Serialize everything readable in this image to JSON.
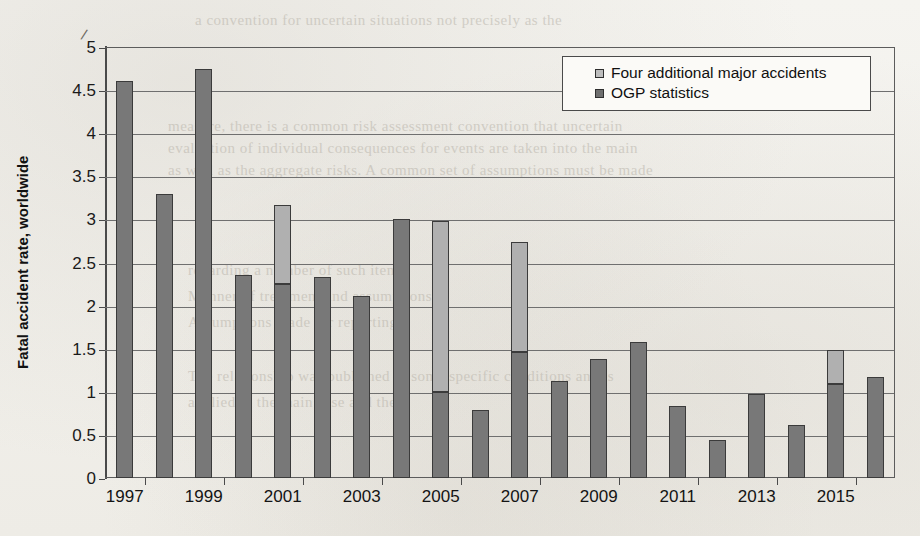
{
  "chart_data": {
    "type": "bar",
    "title": "",
    "subtitle": "",
    "xlabel": "",
    "ylabel": "Fatal accident rate, worldwide",
    "ylim": [
      0,
      5
    ],
    "ytick_step": 0.5,
    "ytick_labels": [
      "0",
      "0.5",
      "1",
      "1.5",
      "2",
      "2.5",
      "3",
      "3.5",
      "4",
      "4.5",
      "5"
    ],
    "grid": true,
    "stacked": true,
    "legend_position": "top-right",
    "categories": [
      "1997",
      "1998",
      "1999",
      "2000",
      "2001",
      "2002",
      "2003",
      "2004",
      "2005",
      "2006",
      "2007",
      "2008",
      "2009",
      "2010",
      "2011",
      "2012",
      "2013",
      "2014",
      "2015",
      "2016"
    ],
    "xtick_labels": [
      "1997",
      "1999",
      "2001",
      "2003",
      "2005",
      "2007",
      "2009",
      "2011",
      "2013",
      "2015"
    ],
    "series": [
      {
        "name": "OGP statistics",
        "color": "#787878",
        "values": [
          4.6,
          3.3,
          4.75,
          2.35,
          2.25,
          2.33,
          2.11,
          3.0,
          1.0,
          0.79,
          1.46,
          1.13,
          1.38,
          1.58,
          0.83,
          0.44,
          0.98,
          0.61,
          1.09,
          1.17
        ]
      },
      {
        "name": "Four additional major accidents",
        "color": "#b0b0b0",
        "values": [
          0.0,
          0.0,
          0.0,
          0.0,
          0.92,
          0.0,
          0.0,
          0.0,
          1.98,
          0.0,
          1.28,
          0.0,
          0.0,
          0.0,
          0.0,
          0.0,
          0.0,
          0.0,
          0.39,
          0.0
        ]
      }
    ],
    "totals": [
      4.6,
      3.3,
      4.75,
      2.35,
      3.17,
      2.33,
      2.11,
      3.0,
      2.98,
      0.79,
      2.74,
      1.13,
      1.38,
      1.58,
      0.83,
      0.44,
      0.98,
      0.61,
      1.48,
      1.17
    ]
  },
  "legend": {
    "items": [
      {
        "label": "Four additional major accidents",
        "swatch": "#bdbdbd"
      },
      {
        "label": "OGP statistics",
        "swatch": "#6f6f6f"
      }
    ]
  },
  "axes": {
    "y_title": "Fatal accident rate, worldwide"
  },
  "scan_artifacts": {
    "stray_mark": "/",
    "bleed_lines": [
      "a convention for uncertain situations not precisely as the",
      "measure, there is a common risk assessment convention that uncertain",
      "evaluation of individual consequences for events are taken into the main",
      "as well as the aggregate risks. A common set of assumptions must be made",
      "regarding a number of such items.",
      "Manner of treatment and assumptions",
      "Assumptions made for reporting",
      "The relationship was published in some specific conditions and is",
      "applied to the main case and the"
    ]
  }
}
